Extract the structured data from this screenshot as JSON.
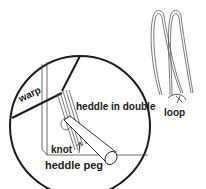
{
  "diagram": {
    "labels": {
      "warp": "warp",
      "heddle": "heddle in double",
      "loop": "loop",
      "knot": "knot",
      "peg": "heddle peg"
    },
    "colors": {
      "stroke": "#1a1a1a",
      "background": "#ffffff"
    }
  }
}
